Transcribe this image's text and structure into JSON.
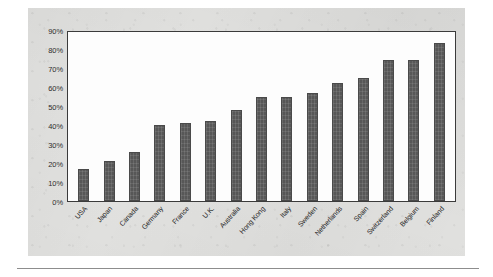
{
  "chart_data": {
    "type": "bar",
    "title": "",
    "subtitle": "",
    "xlabel": "",
    "ylabel": "",
    "ylim": [
      0,
      90
    ],
    "grid": false,
    "legend": null,
    "y_tick_labels": [
      "0%",
      "10%",
      "20%",
      "30%",
      "40%",
      "50%",
      "60%",
      "70%",
      "80%",
      "90%"
    ],
    "y_tick_values": [
      0,
      10,
      20,
      30,
      40,
      50,
      60,
      70,
      80,
      90
    ],
    "categories": [
      "USA",
      "Japan",
      "Canada",
      "Germany",
      "France",
      "U.K.",
      "Australia",
      "Hong Kong",
      "Italy",
      "Sweden",
      "Netherlands",
      "Spain",
      "Switzerland",
      "Belgium",
      "Finland"
    ],
    "values": [
      17,
      21,
      26,
      40,
      41,
      42,
      48,
      55,
      55,
      57,
      62,
      65,
      74,
      74,
      83
    ],
    "units": "percent",
    "bar_color": "#5b5b5b",
    "plot_background": "#fdfdfd",
    "figure_background": "#e3e3e1"
  }
}
